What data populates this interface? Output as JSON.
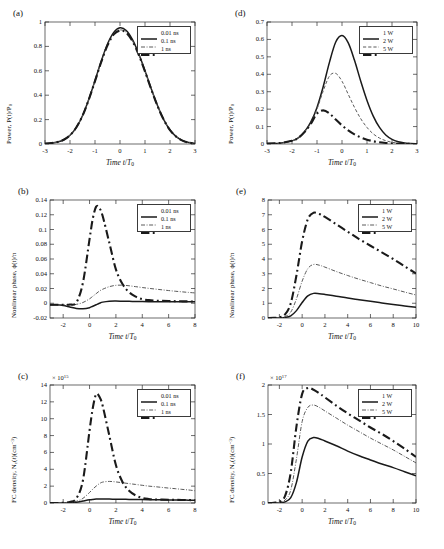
{
  "figure": {
    "panels": [
      "a",
      "b",
      "c",
      "d",
      "e",
      "f"
    ],
    "axis_color": "#2b2b2b",
    "series_colors": {
      "s1": "#1a1a1a",
      "s2": "#5a5a5a",
      "s3": "#1a1a1a"
    }
  },
  "chart_data": [
    {
      "id": "a",
      "tag": "(a)",
      "type": "line",
      "title": "",
      "xlabel": "Time t/T",
      "xlabel_sub": "0",
      "ylabel": "Power, P(t)/P",
      "ylabel_sub": "0",
      "xlim": [
        -3,
        3
      ],
      "ylim": [
        0,
        1
      ],
      "xticks": [
        "-3",
        "-2",
        "-1",
        "0",
        "1",
        "2",
        "3"
      ],
      "xtickvals": [
        -3,
        -2,
        -1,
        0,
        1,
        2,
        3
      ],
      "yticks": [
        "0",
        "0.2",
        "0.4",
        "0.6",
        "0.8",
        "1"
      ],
      "ytickvals": [
        0,
        0.2,
        0.4,
        0.6,
        0.8,
        1
      ],
      "exponent": "",
      "grid": false,
      "legend_position": "top-right",
      "legend": [
        "0.01 ns",
        "0.1 ns",
        "1 ns"
      ],
      "x": [
        -3,
        -2.75,
        -2.5,
        -2.25,
        -2,
        -1.75,
        -1.5,
        -1.25,
        -1,
        -0.75,
        -0.5,
        -0.25,
        0,
        0.25,
        0.5,
        0.75,
        1,
        1.25,
        1.5,
        1.75,
        2,
        2.25,
        2.5,
        2.75,
        3
      ],
      "series": [
        {
          "name": "0.01 ns",
          "style": "solid",
          "width": 1.5,
          "values": [
            0.003,
            0.007,
            0.016,
            0.035,
            0.072,
            0.135,
            0.232,
            0.365,
            0.52,
            0.68,
            0.82,
            0.915,
            0.952,
            0.93,
            0.855,
            0.74,
            0.6,
            0.452,
            0.315,
            0.2,
            0.115,
            0.06,
            0.028,
            0.012,
            0.004
          ]
        },
        {
          "name": "0.1 ns",
          "style": "dashdot",
          "width": 1.0,
          "values": [
            0.003,
            0.007,
            0.016,
            0.035,
            0.072,
            0.135,
            0.232,
            0.365,
            0.518,
            0.675,
            0.812,
            0.902,
            0.935,
            0.915,
            0.845,
            0.733,
            0.596,
            0.45,
            0.313,
            0.199,
            0.114,
            0.06,
            0.028,
            0.012,
            0.004
          ]
        },
        {
          "name": "1 ns",
          "style": "dashdot",
          "width": 2.1,
          "values": [
            0.003,
            0.007,
            0.016,
            0.035,
            0.072,
            0.135,
            0.231,
            0.363,
            0.515,
            0.672,
            0.808,
            0.898,
            0.93,
            0.912,
            0.842,
            0.731,
            0.594,
            0.449,
            0.312,
            0.198,
            0.114,
            0.06,
            0.028,
            0.012,
            0.004
          ]
        }
      ]
    },
    {
      "id": "b",
      "tag": "(b)",
      "type": "line",
      "title": "",
      "xlabel": "Time t/T",
      "xlabel_sub": "0",
      "ylabel": "Nonlinear phase, ϕ(t)/π",
      "ylabel_sub": "",
      "xlim": [
        -3,
        8
      ],
      "ylim": [
        -0.02,
        0.14
      ],
      "xticks": [
        "-2",
        "0",
        "2",
        "4",
        "6",
        "8"
      ],
      "xtickvals": [
        -2,
        0,
        2,
        4,
        6,
        8
      ],
      "yticks": [
        "-0.02",
        "0",
        "0.02",
        "0.04",
        "0.06",
        "0.08",
        "0.1",
        "0.12",
        "0.14"
      ],
      "ytickvals": [
        -0.02,
        0,
        0.02,
        0.04,
        0.06,
        0.08,
        0.1,
        0.12,
        0.14
      ],
      "exponent": "",
      "grid": false,
      "legend_position": "top-right",
      "legend": [
        "0.01 ns",
        "0.1 ns",
        "1 ns"
      ],
      "x": [
        -3,
        -2.5,
        -2,
        -1.5,
        -1,
        -0.5,
        0,
        0.25,
        0.5,
        0.75,
        1,
        1.5,
        2,
        2.5,
        3,
        3.5,
        4,
        4.5,
        5,
        5.5,
        6,
        6.5,
        7,
        7.5,
        8
      ],
      "series": [
        {
          "name": "0.01 ns",
          "style": "solid",
          "width": 1.5,
          "values": [
            -0.002,
            -0.002,
            -0.003,
            -0.005,
            -0.007,
            -0.0075,
            -0.006,
            -0.004,
            -0.002,
            0.0,
            0.0015,
            0.0028,
            0.003,
            0.0028,
            0.0026,
            0.0024,
            0.0023,
            0.0022,
            0.0022,
            0.0021,
            0.0021,
            0.002,
            0.002,
            0.002,
            0.002
          ]
        },
        {
          "name": "0.1 ns",
          "style": "dashdot",
          "width": 1.0,
          "values": [
            -0.002,
            -0.002,
            -0.002,
            -0.0022,
            -0.0015,
            0.001,
            0.006,
            0.0095,
            0.013,
            0.0165,
            0.019,
            0.0225,
            0.0243,
            0.0245,
            0.0237,
            0.0225,
            0.0213,
            0.0202,
            0.0192,
            0.0182,
            0.0172,
            0.0163,
            0.0155,
            0.0147,
            0.014
          ]
        },
        {
          "name": "1 ns",
          "style": "dashdot",
          "width": 2.1,
          "values": [
            -0.002,
            -0.002,
            -0.002,
            -0.0018,
            0.001,
            0.028,
            0.087,
            0.115,
            0.131,
            0.129,
            0.118,
            0.082,
            0.046,
            0.026,
            0.015,
            0.009,
            0.0055,
            0.0042,
            0.0035,
            0.0032,
            0.003,
            0.0028,
            0.0026,
            0.0025,
            0.0024
          ]
        }
      ]
    },
    {
      "id": "c",
      "tag": "(c)",
      "type": "line",
      "title": "",
      "xlabel": "Time t/T",
      "xlabel_sub": "0",
      "ylabel": "FC density, N",
      "ylabel_sub": "c",
      "ylabel_tail": "(t)(cm−3)",
      "xlim": [
        -3,
        8
      ],
      "ylim": [
        0,
        14
      ],
      "xticks": [
        "-2",
        "0",
        "2",
        "4",
        "6",
        "8"
      ],
      "xtickvals": [
        -2,
        0,
        2,
        4,
        6,
        8
      ],
      "yticks": [
        "0",
        "2",
        "4",
        "6",
        "8",
        "10",
        "12",
        "14"
      ],
      "ytickvals": [
        0,
        2,
        4,
        6,
        8,
        10,
        12,
        14
      ],
      "exponent": "× 10",
      "exponent_sup": "15",
      "grid": false,
      "legend_position": "top-right",
      "legend": [
        "0.01 ns",
        "0.1 ns",
        "1 ns"
      ],
      "x": [
        -3,
        -2.5,
        -2,
        -1.5,
        -1,
        -0.5,
        0,
        0.25,
        0.5,
        0.75,
        1,
        1.5,
        2,
        2.5,
        3,
        3.5,
        4,
        4.5,
        5,
        5.5,
        6,
        6.5,
        7,
        7.5,
        8
      ],
      "series": [
        {
          "name": "0.01 ns",
          "style": "solid",
          "width": 1.5,
          "values": [
            0.0,
            0.0,
            0.01,
            0.03,
            0.1,
            0.24,
            0.38,
            0.43,
            0.46,
            0.47,
            0.47,
            0.46,
            0.45,
            0.44,
            0.43,
            0.42,
            0.41,
            0.4,
            0.39,
            0.38,
            0.37,
            0.36,
            0.35,
            0.34,
            0.33
          ]
        },
        {
          "name": "0.1 ns",
          "style": "dashdot",
          "width": 1.0,
          "values": [
            0.0,
            0.0,
            0.02,
            0.07,
            0.2,
            0.55,
            1.25,
            1.65,
            2.0,
            2.3,
            2.48,
            2.56,
            2.5,
            2.4,
            2.3,
            2.2,
            2.1,
            2.0,
            1.93,
            1.85,
            1.77,
            1.7,
            1.62,
            1.55,
            1.45
          ]
        },
        {
          "name": "1 ns",
          "style": "dashdot",
          "width": 2.1,
          "values": [
            0.0,
            0.0,
            0.03,
            0.12,
            0.55,
            2.7,
            8.6,
            11.3,
            12.9,
            12.6,
            11.5,
            8.0,
            4.5,
            2.5,
            1.45,
            0.9,
            0.6,
            0.48,
            0.42,
            0.4,
            0.38,
            0.37,
            0.36,
            0.35,
            0.34
          ]
        }
      ]
    },
    {
      "id": "d",
      "tag": "(d)",
      "type": "line",
      "title": "",
      "xlabel": "Time t/T",
      "xlabel_sub": "0",
      "ylabel": "Power, P(t)/P",
      "ylabel_sub": "0",
      "xlim": [
        -3,
        3
      ],
      "ylim": [
        0,
        0.7
      ],
      "xticks": [
        "-3",
        "-2",
        "-1",
        "0",
        "1",
        "2",
        "3"
      ],
      "xtickvals": [
        -3,
        -2,
        -1,
        0,
        1,
        2,
        3
      ],
      "yticks": [
        "0",
        "0.1",
        "0.2",
        "0.3",
        "0.4",
        "0.5",
        "0.6",
        "0.7"
      ],
      "ytickvals": [
        0,
        0.1,
        0.2,
        0.3,
        0.4,
        0.5,
        0.6,
        0.7
      ],
      "exponent": "",
      "grid": false,
      "legend_position": "top-right",
      "legend": [
        "1 W",
        "2 W",
        "5 W"
      ],
      "x": [
        -3,
        -2.5,
        -2,
        -1.75,
        -1.5,
        -1.25,
        -1,
        -0.75,
        -0.5,
        -0.25,
        0,
        0.25,
        0.5,
        0.75,
        1,
        1.25,
        1.5,
        1.75,
        2,
        2.25,
        2.5,
        2.75,
        3
      ],
      "series": [
        {
          "name": "1 W",
          "style": "solid",
          "width": 1.5,
          "values": [
            0.002,
            0.005,
            0.018,
            0.035,
            0.07,
            0.125,
            0.21,
            0.33,
            0.47,
            0.585,
            0.622,
            0.58,
            0.48,
            0.36,
            0.25,
            0.16,
            0.095,
            0.052,
            0.027,
            0.013,
            0.006,
            0.003,
            0.001
          ]
        },
        {
          "name": "2 W",
          "style": "dashed",
          "width": 1.0,
          "values": [
            0.002,
            0.005,
            0.018,
            0.035,
            0.07,
            0.12,
            0.2,
            0.305,
            0.39,
            0.405,
            0.36,
            0.285,
            0.21,
            0.145,
            0.095,
            0.058,
            0.034,
            0.019,
            0.01,
            0.005,
            0.002,
            0.001,
            0.0005
          ]
        },
        {
          "name": "5 W",
          "style": "dashdot",
          "width": 2.1,
          "values": [
            0.002,
            0.005,
            0.018,
            0.035,
            0.068,
            0.115,
            0.175,
            0.193,
            0.175,
            0.14,
            0.107,
            0.078,
            0.055,
            0.038,
            0.025,
            0.016,
            0.01,
            0.006,
            0.003,
            0.0015,
            0.001,
            0.0005,
            0.0003
          ]
        }
      ]
    },
    {
      "id": "e",
      "tag": "(e)",
      "type": "line",
      "title": "",
      "xlabel": "Time t/T",
      "xlabel_sub": "0",
      "ylabel": "Nonlinear phase, ϕ(t)/π",
      "ylabel_sub": "",
      "xlim": [
        -3,
        10
      ],
      "ylim": [
        0,
        8
      ],
      "xticks": [
        "-2",
        "0",
        "2",
        "4",
        "6",
        "8",
        "10"
      ],
      "xtickvals": [
        -2,
        0,
        2,
        4,
        6,
        8,
        10
      ],
      "yticks": [
        "0",
        "1",
        "2",
        "3",
        "4",
        "5",
        "6",
        "7",
        "8"
      ],
      "ytickvals": [
        0,
        1,
        2,
        3,
        4,
        5,
        6,
        7,
        8
      ],
      "exponent": "",
      "grid": false,
      "legend_position": "top-right",
      "legend": [
        "1 W",
        "2 W",
        "5 W"
      ],
      "x": [
        -3,
        -2.5,
        -2,
        -1.5,
        -1,
        -0.5,
        0,
        0.5,
        1,
        1.5,
        2,
        3,
        4,
        5,
        6,
        7,
        8,
        9,
        10
      ],
      "series": [
        {
          "name": "1 W",
          "style": "solid",
          "width": 1.5,
          "values": [
            0.0,
            0.0,
            0.01,
            0.04,
            0.15,
            0.5,
            1.05,
            1.5,
            1.67,
            1.65,
            1.6,
            1.48,
            1.35,
            1.24,
            1.13,
            1.02,
            0.92,
            0.82,
            0.73
          ]
        },
        {
          "name": "2 W",
          "style": "dashdot",
          "width": 1.0,
          "values": [
            0.0,
            0.0,
            0.02,
            0.09,
            0.4,
            1.3,
            2.5,
            3.35,
            3.63,
            3.58,
            3.45,
            3.15,
            2.88,
            2.63,
            2.4,
            2.17,
            1.97,
            1.76,
            1.56
          ]
        },
        {
          "name": "5 W",
          "style": "dashdot",
          "width": 2.1,
          "values": [
            0.0,
            0.01,
            0.05,
            0.25,
            1.0,
            2.9,
            5.2,
            6.7,
            7.13,
            7.05,
            6.85,
            6.35,
            5.85,
            5.35,
            4.9,
            4.45,
            4.0,
            3.5,
            3.02
          ]
        }
      ]
    },
    {
      "id": "f",
      "tag": "(f)",
      "type": "line",
      "title": "",
      "xlabel": "Time t/T",
      "xlabel_sub": "0",
      "ylabel": "FC density, N",
      "ylabel_sub": "c",
      "ylabel_tail": "(t)(cm−3)",
      "xlim": [
        -3,
        10
      ],
      "ylim": [
        0,
        2
      ],
      "xticks": [
        "-2",
        "0",
        "2",
        "4",
        "6",
        "8",
        "10"
      ],
      "xtickvals": [
        -2,
        0,
        2,
        4,
        6,
        8,
        10
      ],
      "yticks": [
        "0",
        "0.5",
        "1",
        "1.5",
        "2"
      ],
      "ytickvals": [
        0,
        0.5,
        1,
        1.5,
        2
      ],
      "exponent": "× 10",
      "exponent_sup": "17",
      "grid": false,
      "legend_position": "top-right",
      "legend": [
        "1 W",
        "2 W",
        "5 W"
      ],
      "x": [
        -3,
        -2.5,
        -2,
        -1.5,
        -1,
        -0.5,
        0,
        0.5,
        1,
        1.5,
        2,
        3,
        4,
        5,
        6,
        7,
        8,
        9,
        10
      ],
      "series": [
        {
          "name": "1 W",
          "style": "solid",
          "width": 1.5,
          "values": [
            0.0,
            0.0,
            0.005,
            0.02,
            0.09,
            0.35,
            0.78,
            1.05,
            1.11,
            1.09,
            1.05,
            0.97,
            0.88,
            0.8,
            0.73,
            0.66,
            0.6,
            0.53,
            0.46
          ]
        },
        {
          "name": "2 W",
          "style": "dashdot",
          "width": 1.0,
          "values": [
            0.0,
            0.0,
            0.01,
            0.05,
            0.22,
            0.75,
            1.38,
            1.62,
            1.66,
            1.62,
            1.56,
            1.44,
            1.32,
            1.21,
            1.1,
            1.0,
            0.9,
            0.79,
            0.68
          ]
        },
        {
          "name": "5 W",
          "style": "dashdot",
          "width": 2.1,
          "values": [
            0.0,
            0.005,
            0.02,
            0.12,
            0.52,
            1.3,
            1.85,
            1.95,
            1.92,
            1.86,
            1.79,
            1.65,
            1.52,
            1.4,
            1.28,
            1.17,
            1.05,
            0.92,
            0.78
          ]
        }
      ]
    }
  ]
}
